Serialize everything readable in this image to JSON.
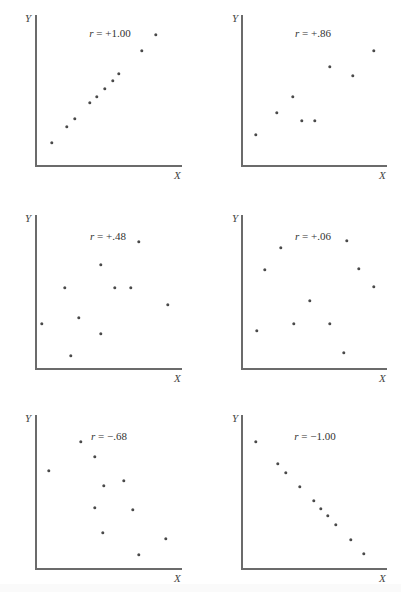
{
  "chart_data": [
    {
      "type": "scatter",
      "title": "",
      "annotation": "r = +1.00",
      "xlabel": "X",
      "ylabel": "Y",
      "grid": false,
      "points": [
        [
          52,
          143
        ],
        [
          67,
          127
        ],
        [
          75,
          119
        ],
        [
          90,
          103
        ],
        [
          97,
          97
        ],
        [
          105,
          89
        ],
        [
          113,
          81
        ],
        [
          119,
          74
        ],
        [
          142,
          51
        ],
        [
          156,
          35
        ]
      ],
      "frame": {
        "x0": 35,
        "y0": 15,
        "x1": 182,
        "yAxis": 165
      },
      "label_x": 110
    },
    {
      "type": "scatter",
      "title": "",
      "annotation": "r = +.86",
      "xlabel": "X",
      "ylabel": "Y",
      "grid": false,
      "points": [
        [
          256,
          135
        ],
        [
          277,
          113
        ],
        [
          293,
          97
        ],
        [
          302,
          121
        ],
        [
          315,
          121
        ],
        [
          330,
          67
        ],
        [
          353,
          76
        ],
        [
          374,
          51
        ]
      ],
      "frame": {
        "x0": 241,
        "y0": 15,
        "x1": 387,
        "yAxis": 165
      },
      "label_x": 313
    },
    {
      "type": "scatter",
      "title": "",
      "annotation": "r = +.48",
      "xlabel": "X",
      "ylabel": "Y",
      "grid": false,
      "points": [
        [
          42,
          324
        ],
        [
          65,
          288
        ],
        [
          79,
          318
        ],
        [
          71,
          356
        ],
        [
          101,
          265
        ],
        [
          101,
          334
        ],
        [
          115,
          288
        ],
        [
          131,
          288
        ],
        [
          139,
          242
        ],
        [
          168,
          305
        ]
      ],
      "frame": {
        "x0": 35,
        "y0": 215,
        "x1": 182,
        "yAxis": 368
      },
      "label_x": 110
    },
    {
      "type": "scatter",
      "title": "",
      "annotation": "r = +.06",
      "xlabel": "X",
      "ylabel": "Y",
      "grid": false,
      "points": [
        [
          257,
          331
        ],
        [
          265,
          270
        ],
        [
          281,
          248
        ],
        [
          294,
          324
        ],
        [
          310,
          301
        ],
        [
          330,
          324
        ],
        [
          344,
          353
        ],
        [
          347,
          241
        ],
        [
          359,
          269
        ],
        [
          374,
          287
        ]
      ],
      "frame": {
        "x0": 241,
        "y0": 215,
        "x1": 387,
        "yAxis": 368
      },
      "label_x": 313
    },
    {
      "type": "scatter",
      "title": "",
      "annotation": "r = −.68",
      "xlabel": "X",
      "ylabel": "Y",
      "grid": false,
      "points": [
        [
          49,
          471
        ],
        [
          81,
          442
        ],
        [
          95,
          457
        ],
        [
          104,
          486
        ],
        [
          95,
          508
        ],
        [
          103,
          533
        ],
        [
          124,
          481
        ],
        [
          133,
          510
        ],
        [
          139,
          555
        ],
        [
          166,
          539
        ]
      ],
      "frame": {
        "x0": 35,
        "y0": 415,
        "x1": 182,
        "yAxis": 568
      },
      "label_x": 110
    },
    {
      "type": "scatter",
      "title": "",
      "annotation": "r = −1.00",
      "xlabel": "X",
      "ylabel": "Y",
      "grid": false,
      "points": [
        [
          256,
          442
        ],
        [
          278,
          464
        ],
        [
          286,
          473
        ],
        [
          300,
          487
        ],
        [
          314,
          501
        ],
        [
          321,
          509
        ],
        [
          328,
          516
        ],
        [
          336,
          525
        ],
        [
          351,
          540
        ],
        [
          364,
          554
        ]
      ],
      "frame": {
        "x0": 241,
        "y0": 415,
        "x1": 387,
        "yAxis": 568
      },
      "label_x": 313
    }
  ],
  "panels": [
    {
      "r_symbol": "r",
      "r_value": " = +1.00",
      "x_label": "X",
      "y_label": "Y"
    },
    {
      "r_symbol": "r",
      "r_value": " = +.86",
      "x_label": "X",
      "y_label": "Y"
    },
    {
      "r_symbol": "r",
      "r_value": " = +.48",
      "x_label": "X",
      "y_label": "Y"
    },
    {
      "r_symbol": "r",
      "r_value": " = +.06",
      "x_label": "X",
      "y_label": "Y"
    },
    {
      "r_symbol": "r",
      "r_value": " = −.68",
      "x_label": "X",
      "y_label": "Y"
    },
    {
      "r_symbol": "r",
      "r_value": " = −1.00",
      "x_label": "X",
      "y_label": "Y"
    }
  ],
  "style": {
    "axis_color": "#6b6b6b",
    "dot_color": "#4a4a4a"
  }
}
